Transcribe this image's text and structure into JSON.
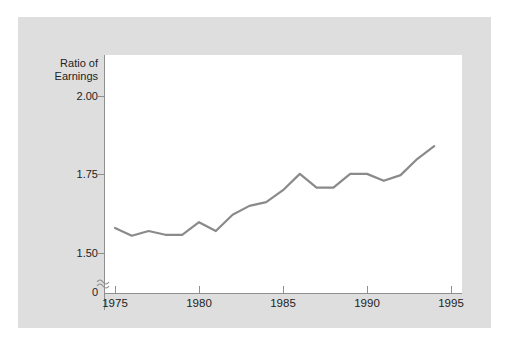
{
  "chart_data": {
    "type": "line",
    "title": "",
    "subtitle": "",
    "xlabel": "",
    "ylabel": "Ratio of Earnings",
    "ylabel_lines": [
      "Ratio of",
      "Earnings"
    ],
    "x": [
      1975,
      1976,
      1977,
      1978,
      1979,
      1980,
      1981,
      1982,
      1983,
      1984,
      1985,
      1986,
      1987,
      1988,
      1989,
      1990,
      1991,
      1992,
      1993,
      1994
    ],
    "values": [
      1.58,
      1.555,
      1.57,
      1.558,
      1.558,
      1.598,
      1.57,
      1.622,
      1.65,
      1.662,
      1.7,
      1.752,
      1.708,
      1.708,
      1.752,
      1.752,
      1.73,
      1.748,
      1.8,
      1.84
    ],
    "series": [
      {
        "name": "Ratio of Earnings",
        "values": [
          1.58,
          1.555,
          1.57,
          1.558,
          1.558,
          1.598,
          1.57,
          1.622,
          1.65,
          1.662,
          1.7,
          1.752,
          1.708,
          1.708,
          1.752,
          1.752,
          1.73,
          1.748,
          1.8,
          1.84
        ]
      }
    ],
    "xlim": [
      1975,
      1995
    ],
    "ylim": [
      1.5,
      2.0
    ],
    "xticks": [
      1975,
      1980,
      1985,
      1990,
      1995
    ],
    "yticks": [
      1.5,
      1.75,
      2.0
    ],
    "ytick_labels": [
      "1.50",
      "1.75",
      "2.00"
    ],
    "xtick_labels": [
      "1975",
      "1980",
      "1985",
      "1990",
      "1995"
    ],
    "zero_label": "0",
    "axis_break": true,
    "axis_break_glyph": "≈",
    "grid": false,
    "legend": false,
    "legend_position": "none",
    "annotations": []
  },
  "style": {
    "line_color": "#8a8a8a",
    "axis_color": "#8f8f8f",
    "plot_background": "#ffffff",
    "figure_background": "#dedede",
    "page_background": "#ffffff",
    "text_color": "#222222"
  }
}
